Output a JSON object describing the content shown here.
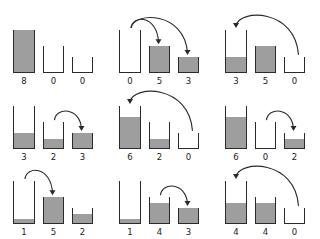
{
  "diagram": {
    "title": "",
    "capacities": [
      8,
      5,
      3
    ],
    "colors": {
      "stroke": "#2a2a2a",
      "fill": "#9e9e9e",
      "background": "#ffffff"
    },
    "panels": [
      {
        "row": 0,
        "col": 0,
        "values": [
          "8",
          "0",
          "0"
        ],
        "arrows": []
      },
      {
        "row": 0,
        "col": 1,
        "values": [
          "0",
          "5",
          "3"
        ],
        "arrows": [
          {
            "from": 0,
            "to": 1
          },
          {
            "from": 0,
            "to": 2
          }
        ]
      },
      {
        "row": 0,
        "col": 2,
        "values": [
          "3",
          "5",
          "0"
        ],
        "arrows": [
          {
            "from": 2,
            "to": 0
          }
        ]
      },
      {
        "row": 1,
        "col": 0,
        "values": [
          "3",
          "2",
          "3"
        ],
        "arrows": [
          {
            "from": 1,
            "to": 2
          }
        ]
      },
      {
        "row": 1,
        "col": 1,
        "values": [
          "6",
          "2",
          "0"
        ],
        "arrows": [
          {
            "from": 2,
            "to": 0
          }
        ]
      },
      {
        "row": 1,
        "col": 2,
        "values": [
          "6",
          "0",
          "2"
        ],
        "arrows": [
          {
            "from": 1,
            "to": 2
          }
        ]
      },
      {
        "row": 2,
        "col": 0,
        "values": [
          "1",
          "5",
          "2"
        ],
        "arrows": [
          {
            "from": 0,
            "to": 1
          }
        ]
      },
      {
        "row": 2,
        "col": 1,
        "values": [
          "1",
          "4",
          "3"
        ],
        "arrows": [
          {
            "from": 1,
            "to": 2
          }
        ]
      },
      {
        "row": 2,
        "col": 2,
        "values": [
          "4",
          "4",
          "0"
        ],
        "arrows": [
          {
            "from": 2,
            "to": 0
          }
        ]
      }
    ]
  }
}
